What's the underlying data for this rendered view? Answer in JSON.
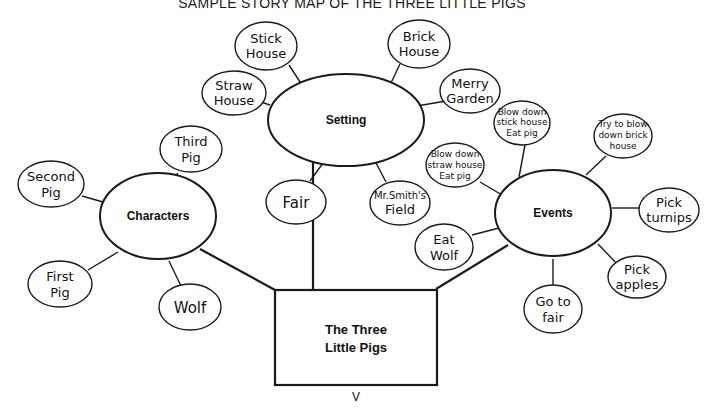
{
  "title": "SAMPLE STORY MAP OF THE THREE LITTLE PIGS",
  "center": {
    "line1": "The Three",
    "line2": "Little Pigs"
  },
  "page_mark": "V",
  "hubs": {
    "setting": "Setting",
    "characters": "Characters",
    "events": "Events"
  },
  "setting_nodes": [
    {
      "line1": "Stick",
      "line2": "House"
    },
    {
      "line1": "Brick",
      "line2": "House"
    },
    {
      "line1": "Straw",
      "line2": "House"
    },
    {
      "line1": "Merry",
      "line2": "Garden"
    },
    {
      "line1": "Fair",
      "line2": ""
    },
    {
      "line1": "Mr.Smith's",
      "line2": "Field"
    }
  ],
  "character_nodes": [
    {
      "line1": "Third",
      "line2": "Pig"
    },
    {
      "line1": "Second",
      "line2": "Pig"
    },
    {
      "line1": "First",
      "line2": "Pig"
    },
    {
      "line1": "Wolf",
      "line2": ""
    }
  ],
  "event_nodes": [
    {
      "line1": "Blow down",
      "line2": "stick house",
      "line3": "Eat pig"
    },
    {
      "line1": "Try to blow",
      "line2": "down brick",
      "line3": "house"
    },
    {
      "line1": "Blow down",
      "line2": "straw house",
      "line3": "Eat pig"
    },
    {
      "line1": "Pick",
      "line2": "turnips",
      "line3": ""
    },
    {
      "line1": "Eat",
      "line2": "Wolf",
      "line3": ""
    },
    {
      "line1": "Pick",
      "line2": "apples",
      "line3": ""
    },
    {
      "line1": "Go to",
      "line2": "fair",
      "line3": ""
    }
  ]
}
